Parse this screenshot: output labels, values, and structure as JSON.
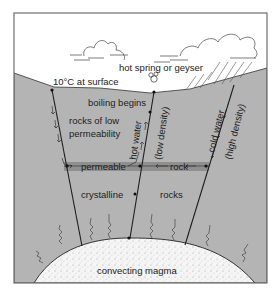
{
  "diagram": {
    "colors": {
      "background": "#ffffff",
      "frame": "#6e6e6e",
      "rock": "#b4b4b4",
      "permeable_band": "#8f8f8f",
      "magma": "#f4f4f4",
      "line": "#1e1e1e"
    },
    "labels": {
      "hot_spring": "hot spring or geyser",
      "surface_temp": "10°C at surface",
      "boiling": "boiling begins",
      "low_perm_1": "rocks of low",
      "low_perm_2": "permeability",
      "hot_water": "hot water",
      "low_density": "(low density)",
      "cold_water": "cold water",
      "high_density": "(high density)",
      "permeable": "permeable",
      "rock": "rock",
      "crystalline": "crystalline",
      "rocks": "rocks",
      "magma": "convecting magma"
    }
  }
}
